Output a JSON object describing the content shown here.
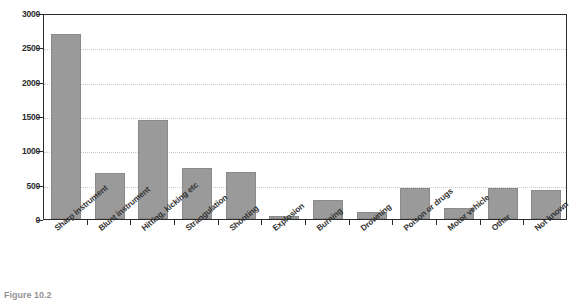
{
  "chart_data": {
    "type": "bar",
    "title": "",
    "subtitle": "",
    "xlabel": "",
    "ylabel": "",
    "ylim": [
      0,
      3000
    ],
    "ytick_step": 500,
    "yticks": [
      "0",
      "500",
      "1000",
      "1500",
      "2000",
      "2500",
      "3000"
    ],
    "grid": true,
    "legend": false,
    "legend_position": "none",
    "bar_color": "#9a9a9a",
    "bar_edge_color": "#8a8a8a",
    "axis_color": "#2b2b2b",
    "gridline_color": "#c8c8c8",
    "categories": [
      "Sharp instrument",
      "Blunt instrument",
      "Hitting, kicking etc",
      "Strangulation",
      "Shooting",
      "Explosion",
      "Burning",
      "Drowning",
      "Poison or drugs",
      "Motor vehicle",
      "Other",
      "Not known"
    ],
    "values": [
      2690,
      670,
      1440,
      750,
      680,
      50,
      280,
      95,
      455,
      165,
      450,
      425
    ]
  },
  "caption": {
    "text": "Figure 10.2"
  }
}
